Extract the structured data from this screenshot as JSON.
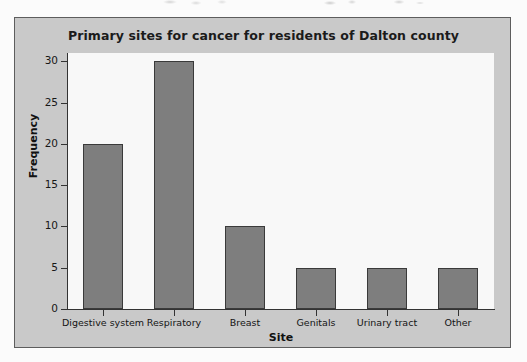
{
  "figure": {
    "panel_background": "#c9c9c9",
    "plot_background": "#f8f8f8",
    "bar_fill": "#7e7e7e",
    "bar_outline": "#3a3a3a",
    "axis_color": "#333333"
  },
  "chart_data": {
    "type": "bar",
    "title": "Primary sites for cancer for residents of Dalton county",
    "xlabel": "Site",
    "ylabel": "Frequency",
    "categories": [
      "Digestive system",
      "Respiratory",
      "Breast",
      "Genitals",
      "Urinary tract",
      "Other"
    ],
    "values": [
      20,
      30,
      10,
      5,
      5,
      5
    ],
    "ylim": [
      0,
      31
    ],
    "yticks": [
      0,
      5,
      10,
      15,
      20,
      25,
      30
    ],
    "ytick_labels": [
      "0",
      "5",
      "10",
      "15",
      "20",
      "25",
      "30"
    ],
    "grid": false,
    "legend": false
  }
}
